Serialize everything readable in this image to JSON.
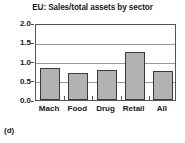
{
  "chart_data": {
    "type": "bar",
    "title": "EU: Sales/total assets by sector",
    "xlabel": "",
    "ylabel": "",
    "categories": [
      "Mach",
      "Food",
      "Drug",
      "Retail",
      "All"
    ],
    "values": [
      0.83,
      0.7,
      0.78,
      1.25,
      0.76
    ],
    "ylim": [
      0.0,
      2.0
    ],
    "yticks": [
      "0.0",
      "0.5",
      "1.0",
      "1.5",
      "2.0"
    ],
    "ytick_values": [
      0.0,
      0.5,
      1.0,
      1.5,
      2.0
    ],
    "grid": true,
    "legend": false,
    "bar_color": "#b2b2b2",
    "bar_edge_color": "#3a3a3a",
    "grid_color": "#9a9a9a",
    "axis_color": "#555555"
  },
  "panel": {
    "caption": "(d)"
  }
}
